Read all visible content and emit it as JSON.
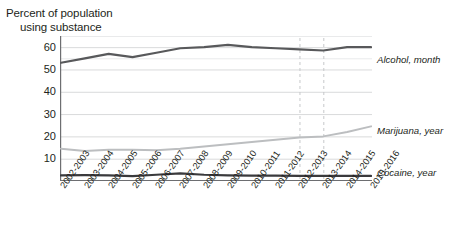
{
  "title": {
    "line1": "Percent of population",
    "line2": "using substance"
  },
  "chart_data": {
    "type": "line",
    "title": "Percent of population using substance",
    "xlabel": "",
    "ylabel": "Percent of population using substance",
    "ylim": [
      0,
      65
    ],
    "yticks": [
      10,
      20,
      30,
      40,
      50,
      60
    ],
    "grid": true,
    "legend_position": "right-inline",
    "categories": [
      "2002-2003",
      "2003-2004",
      "2004-2005",
      "2005-2006",
      "2006-2007",
      "2007-2008",
      "2008-2009",
      "2009-2010",
      "2010-2011",
      "2011-2012",
      "2012-2013",
      "2013-2014",
      "2014-2015",
      "2015-2016"
    ],
    "series": [
      {
        "name": "Alcohol, month",
        "color": "#58595b",
        "width": 2.2,
        "values": [
          53.0,
          55.0,
          57.0,
          55.5,
          57.5,
          59.5,
          60.0,
          61.0,
          60.0,
          59.5,
          59.0,
          58.5,
          60.0,
          60.0
        ]
      },
      {
        "name": "Marijuana, year",
        "color": "#bcbec0",
        "width": 2.0,
        "values": [
          14.5,
          13.5,
          14.0,
          14.0,
          13.8,
          14.5,
          15.5,
          16.5,
          17.5,
          18.5,
          19.5,
          20.0,
          22.0,
          24.5
        ]
      },
      {
        "name": "Cocaine, year",
        "color": "#3a3a3c",
        "width": 2.2,
        "values": [
          2.5,
          2.6,
          2.5,
          2.2,
          2.8,
          3.4,
          2.8,
          2.5,
          2.4,
          2.4,
          2.3,
          2.3,
          2.3,
          2.3
        ]
      }
    ],
    "vertical_markers": [
      {
        "at_category": "2012-2013",
        "style": "dashed"
      },
      {
        "at_category": "2013-2014",
        "style": "dashed"
      }
    ],
    "colors": {
      "grid": "#d9dadb",
      "axis": "#6d6e71",
      "marker": "#c7c8ca",
      "text": "#231f20"
    }
  }
}
